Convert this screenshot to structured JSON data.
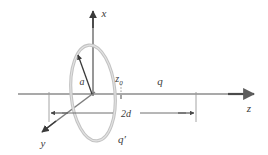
{
  "figure": {
    "background_color": "#ffffff",
    "width": 268,
    "height": 155
  },
  "axes": {
    "x": {
      "label": "x",
      "direction": "up",
      "color": "#555555"
    },
    "y": {
      "label": "y",
      "direction": "down-left",
      "color": "#555555"
    },
    "z": {
      "label": "z",
      "direction": "right",
      "color": "#8a8a8a"
    }
  },
  "ring": {
    "name": "charged-ring",
    "radius_label": "a",
    "color": "#bdbdbd",
    "stroke_width": 3
  },
  "labels": {
    "radius": "a",
    "image_charge": "q′",
    "source_charge": "q",
    "position_symbol": "z",
    "position_subscript": "0",
    "dimension": "2d"
  },
  "colors": {
    "ink": "#3a3a3a",
    "axis_gray": "#8a8a8a",
    "ring_gray": "#bdbdbd",
    "dimension_gray": "#6e6e6e"
  }
}
